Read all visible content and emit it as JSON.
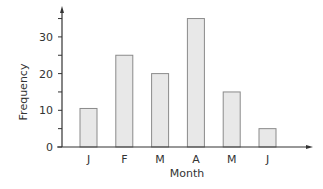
{
  "chart_data": {
    "type": "bar",
    "title": "",
    "xlabel": "Month",
    "ylabel": "Frequency",
    "categories": [
      "J",
      "F",
      "M",
      "A",
      "M",
      "J"
    ],
    "values": [
      10.5,
      25,
      20,
      35,
      15,
      5
    ],
    "yticks": [
      0,
      10,
      20,
      30
    ],
    "ylim": [
      0,
      37
    ],
    "grid": false,
    "legend": null,
    "bar_color": "#e8e8e8",
    "bar_edge_color": "#8a8a8a"
  }
}
